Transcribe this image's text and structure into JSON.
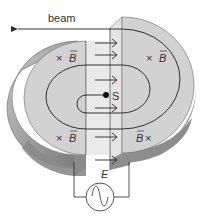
{
  "diagram": {
    "labels": {
      "beam": "beam",
      "source": "S",
      "efield": "E",
      "bfield_symbol": "B",
      "into_page": "×"
    },
    "bfield_markers": [
      {
        "id": "left-top",
        "text": "×B",
        "x": 52,
        "y": 62
      },
      {
        "id": "right-top",
        "text": "×B",
        "x": 146,
        "y": 62
      },
      {
        "id": "left-bottom",
        "text": "×B",
        "x": 52,
        "y": 137
      },
      {
        "id": "right-bottom",
        "text": "B×",
        "x": 136,
        "y": 137
      }
    ],
    "components": {
      "left_dee": "left D-shaped electrode",
      "right_dee": "right D-shaped electrode",
      "gap": "accelerating gap",
      "ac_source": "alternating voltage source",
      "spiral": "particle spiral trajectory"
    },
    "colors": {
      "dee_face": "#d2d2d2",
      "dee_edge_dark": "#8a8a8a",
      "dee_edge_mid": "#b0b0b0",
      "gap": "#e6e6e6",
      "line": "#2a2a2a",
      "background": "#ffffff"
    }
  }
}
